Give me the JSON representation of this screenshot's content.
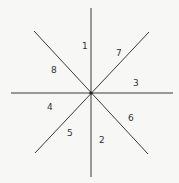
{
  "diagram": {
    "type": "radial-sectors",
    "center": {
      "x": 91,
      "y": 93
    },
    "lines": [
      {
        "id": "vertical",
        "x1": 91,
        "y1": 8,
        "x2": 91,
        "y2": 177
      },
      {
        "id": "horizontal",
        "x1": 11,
        "y1": 93,
        "x2": 173,
        "y2": 93
      },
      {
        "id": "diagonal-down",
        "x1": 34,
        "y1": 31,
        "x2": 148,
        "y2": 154
      },
      {
        "id": "diagonal-up",
        "x1": 149,
        "y1": 32,
        "x2": 35,
        "y2": 153
      }
    ],
    "sector_labels": [
      {
        "text": "1",
        "x": 82,
        "y": 49
      },
      {
        "text": "7",
        "x": 116,
        "y": 56
      },
      {
        "text": "8",
        "x": 54,
        "y": 73
      },
      {
        "text": "3",
        "x": 135,
        "y": 86
      },
      {
        "text": "4",
        "x": 49,
        "y": 110
      },
      {
        "text": "6",
        "x": 130,
        "y": 121
      },
      {
        "text": "5",
        "x": 69,
        "y": 136
      },
      {
        "text": "2",
        "x": 101,
        "y": 143
      }
    ]
  }
}
